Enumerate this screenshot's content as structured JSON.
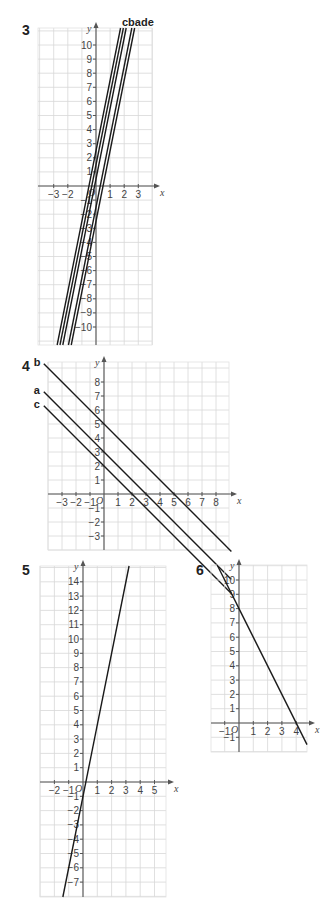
{
  "chart_data": [
    {
      "type": "line",
      "question": "3",
      "title": "",
      "xlabel": "x",
      "ylabel": "y",
      "xlim": [
        -4,
        4
      ],
      "ylim": [
        -11,
        11
      ],
      "grid": true,
      "x_ticks": [
        -3,
        -2,
        1,
        2,
        3
      ],
      "y_ticks": [
        10,
        9,
        8,
        7,
        6,
        5,
        4,
        3,
        2,
        1,
        -1,
        -2,
        -3,
        -4,
        -5,
        -6,
        -7,
        -8,
        -9,
        -10
      ],
      "origin_label": "O",
      "line_labels_text": "cbade",
      "series": [
        {
          "name": "c",
          "slope": 5,
          "intercept": 2.5
        },
        {
          "name": "b",
          "slope": 5,
          "intercept": 1.5
        },
        {
          "name": "a",
          "slope": 5,
          "intercept": 0.5
        },
        {
          "name": "d",
          "slope": 5,
          "intercept": -1.5
        },
        {
          "name": "e",
          "slope": 5,
          "intercept": -2.5
        }
      ]
    },
    {
      "type": "line",
      "question": "4",
      "title": "",
      "xlabel": "x",
      "ylabel": "y",
      "xlim": [
        -4,
        9
      ],
      "ylim": [
        -4,
        9
      ],
      "grid": true,
      "x_ticks": [
        -3,
        -2,
        -1,
        1,
        2,
        3,
        4,
        5,
        6,
        7,
        8
      ],
      "y_ticks": [
        8,
        7,
        6,
        5,
        4,
        3,
        2,
        1,
        -1,
        -2,
        -3
      ],
      "origin_label": "O",
      "series": [
        {
          "name": "b",
          "slope": -1,
          "intercept": 5
        },
        {
          "name": "a",
          "slope": -1,
          "intercept": 3
        },
        {
          "name": "c",
          "slope": -1,
          "intercept": 2
        }
      ]
    },
    {
      "type": "line",
      "question": "5",
      "title": "",
      "xlabel": "x",
      "ylabel": "y",
      "xlim": [
        -3,
        6
      ],
      "ylim": [
        -8,
        15
      ],
      "grid": true,
      "x_ticks": [
        -2,
        -1,
        1,
        2,
        3,
        4,
        5
      ],
      "y_ticks": [
        14,
        13,
        12,
        11,
        10,
        9,
        8,
        7,
        6,
        5,
        4,
        3,
        2,
        1,
        -1,
        -2,
        -3,
        -4,
        -5,
        -6,
        -7
      ],
      "origin_label": "O",
      "series": [
        {
          "name": "line",
          "slope": 5,
          "intercept": -1
        }
      ]
    },
    {
      "type": "line",
      "question": "6",
      "title": "",
      "xlabel": "x",
      "ylabel": "y",
      "xlim": [
        -2,
        5
      ],
      "ylim": [
        -2,
        11
      ],
      "grid": true,
      "x_ticks": [
        -1,
        1,
        2,
        3,
        4
      ],
      "y_ticks": [
        10,
        9,
        8,
        7,
        6,
        5,
        4,
        3,
        2,
        1,
        -1
      ],
      "origin_label": "O",
      "series": [
        {
          "name": "line",
          "slope": -2,
          "intercept": 8
        }
      ]
    }
  ],
  "questions": {
    "q3": "3",
    "q4": "4",
    "q5": "5",
    "q6": "6"
  },
  "colors": {
    "line": "#1a1a1a",
    "grid": "#d8d8d8",
    "axis": "#555555"
  }
}
